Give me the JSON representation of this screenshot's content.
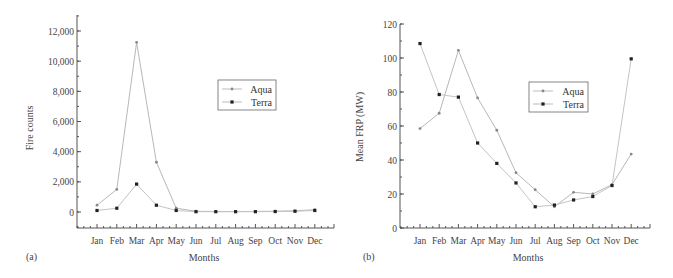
{
  "chart_data": [
    {
      "type": "line",
      "panel_label": "(a)",
      "title": "",
      "xlabel": "Months",
      "ylabel": "Fire counts",
      "categories": [
        "Jan",
        "Feb",
        "Mar",
        "Apr",
        "May",
        "Jun",
        "Jul",
        "Aug",
        "Sep",
        "Oct",
        "Nov",
        "Dec"
      ],
      "ylim": [
        -1000,
        13000
      ],
      "yticks": [
        0,
        2000,
        4000,
        6000,
        8000,
        10000,
        12000
      ],
      "ytick_labels": [
        "0",
        "2,000",
        "4,000",
        "6,000",
        "8,000",
        "10,000",
        "12,000"
      ],
      "grid": false,
      "legend_position": "upper right",
      "series": [
        {
          "name": "Aqua",
          "color": "#aaaaaa",
          "marker": "small-dot",
          "values": [
            450,
            1500,
            11250,
            3300,
            250,
            50,
            30,
            30,
            40,
            50,
            80,
            150
          ]
        },
        {
          "name": "Terra",
          "color": "#222222",
          "marker": "square-dot",
          "values": [
            100,
            250,
            1850,
            450,
            100,
            20,
            20,
            20,
            20,
            30,
            50,
            100
          ]
        }
      ]
    },
    {
      "type": "line",
      "panel_label": "(b)",
      "title": "",
      "xlabel": "Months",
      "ylabel": "Mean FRP (MW)",
      "categories": [
        "Jan",
        "Feb",
        "Mar",
        "Apr",
        "May",
        "Jun",
        "Jul",
        "Aug",
        "Sep",
        "Oct",
        "Nov",
        "Dec"
      ],
      "ylim": [
        0,
        120
      ],
      "yticks": [
        0,
        20,
        40,
        60,
        80,
        100,
        120
      ],
      "ytick_labels": [
        "0",
        "20",
        "40",
        "60",
        "80",
        "100",
        "120"
      ],
      "grid": false,
      "legend_position": "upper right",
      "series": [
        {
          "name": "Aqua",
          "color": "#aaaaaa",
          "marker": "small-dot",
          "values": [
            58.5,
            67.5,
            104.5,
            76.5,
            57.5,
            32.5,
            22.5,
            12.5,
            21,
            20,
            25.5,
            43.5
          ]
        },
        {
          "name": "Terra",
          "color": "#222222",
          "marker": "square-dot",
          "values": [
            108.5,
            78.5,
            77,
            50,
            38,
            26.5,
            12.5,
            13.5,
            16.5,
            18.5,
            25,
            99.5
          ]
        }
      ]
    }
  ],
  "panels": {
    "a": {
      "label": "(a)",
      "xlabel": "Months",
      "ylabel": "Fire counts",
      "legend": [
        "Aqua",
        "Terra"
      ]
    },
    "b": {
      "label": "(b)",
      "xlabel": "Months",
      "ylabel": "Mean FRP (MW)",
      "legend": [
        "Aqua",
        "Terra"
      ]
    }
  }
}
